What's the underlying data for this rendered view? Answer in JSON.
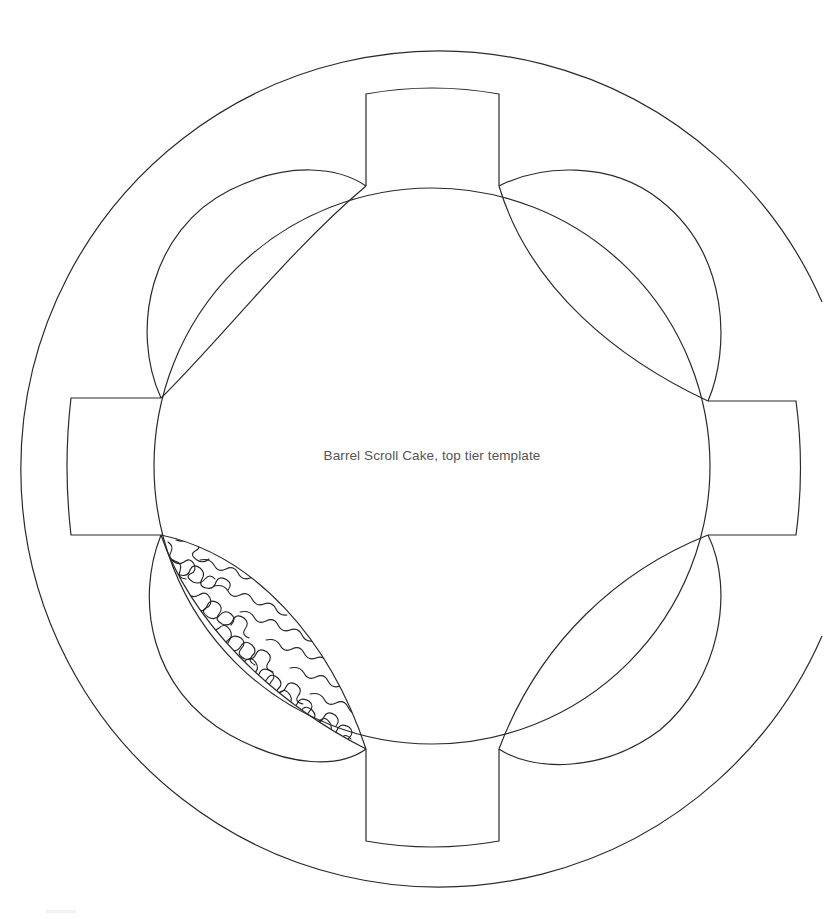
{
  "diagram": {
    "title": "Barrel Scroll Cake, top tier template",
    "stroke_color": "#2a2a2a",
    "label_color": "#555555",
    "background": "#ffffff",
    "center": [
      432,
      466
    ],
    "inner_circle_radius": 278,
    "outer_ring_radius": 418,
    "outer_ring_open_side": "right",
    "tabs": [
      {
        "name": "top",
        "position": "top"
      },
      {
        "name": "right",
        "position": "right"
      },
      {
        "name": "bottom",
        "position": "bottom"
      },
      {
        "name": "left",
        "position": "left"
      }
    ],
    "petals": [
      {
        "name": "upper-left",
        "filled": false
      },
      {
        "name": "upper-right",
        "filled": false
      },
      {
        "name": "lower-right",
        "filled": false
      },
      {
        "name": "lower-left",
        "filled": true,
        "pattern": "scribble"
      }
    ]
  }
}
